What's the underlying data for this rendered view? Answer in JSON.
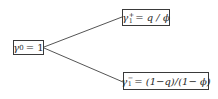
{
  "diagram": {
    "type": "binomial-tree",
    "root": {
      "symbol": "γ",
      "subscript": "0",
      "rhs": "= 1"
    },
    "children": [
      {
        "symbol": "γ",
        "subscript": "1",
        "superscript": "+",
        "rhs": "= q / ϕ"
      },
      {
        "symbol": "γ",
        "subscript": "1",
        "superscript": "−",
        "rhs": "= (1−q)/(1− ϕ)"
      }
    ],
    "edges": [
      {
        "from": "root",
        "to": "children.0"
      },
      {
        "from": "root",
        "to": "children.1"
      }
    ],
    "colors": {
      "line": "#555555",
      "border": "#3a3a3a",
      "text": "#2a2a2a",
      "background": "#ffffff"
    }
  }
}
